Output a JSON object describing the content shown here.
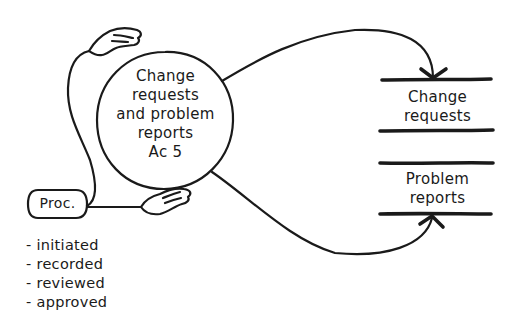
{
  "diagram": {
    "type": "data-flow diagram (hand-drawn)",
    "process": {
      "label_lines": [
        "Change",
        "requests",
        "and problem",
        "reports",
        "Ac 5"
      ],
      "shape": "circle"
    },
    "external_entity": {
      "label": "Proc."
    },
    "data_stores": [
      {
        "label_lines": [
          "Change",
          "requests"
        ]
      },
      {
        "label_lines": [
          "Problem",
          "reports"
        ]
      }
    ],
    "procedure_steps": [
      "- initiated",
      "- recorded",
      "- reviewed",
      "- approved"
    ],
    "flows": [
      {
        "from": "process",
        "to": "data_store_change_requests",
        "arrow": "down-into-store"
      },
      {
        "from": "process",
        "to": "data_store_problem_reports",
        "arrow": "up-into-store"
      },
      {
        "from": "external_entity",
        "to": "process",
        "connector": "hand-upper"
      },
      {
        "from": "external_entity",
        "to": "process",
        "connector": "hand-lower"
      }
    ],
    "icons": [
      "hand-icon",
      "hand-icon"
    ],
    "colors": {
      "ink": "#1a1a1a",
      "background": "#ffffff"
    }
  }
}
